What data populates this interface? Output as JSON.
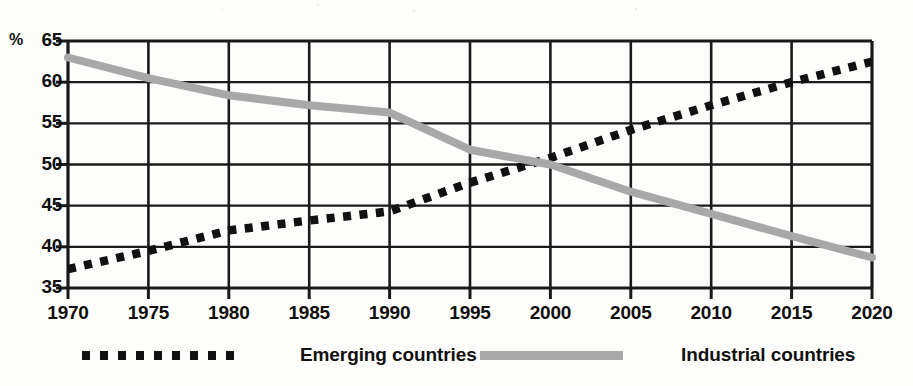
{
  "axis": {
    "unit_symbol": "%",
    "y_ticks": [
      "65",
      "60",
      "55",
      "50",
      "45",
      "40",
      "35"
    ],
    "x_ticks": [
      "1970",
      "1975",
      "1980",
      "1985",
      "1990",
      "1995",
      "2000",
      "2005",
      "2010",
      "2015",
      "2020"
    ]
  },
  "legend": {
    "items": [
      {
        "label": "Emerging countries",
        "style": "dotted",
        "color": "#111111"
      },
      {
        "label": "Industrial countries",
        "style": "solid",
        "color": "#a8a8a8"
      }
    ]
  },
  "colors": {
    "emerging": "#111111",
    "industrial": "#a8a8a8",
    "grid": "#1a1a1a",
    "background": "#fdfdfc"
  },
  "chart_data": {
    "type": "line",
    "title": "",
    "subtitle": "",
    "xlabel": "",
    "ylabel": "%",
    "xlim": [
      1970,
      2020
    ],
    "ylim": [
      35,
      65
    ],
    "ytick_step": 5,
    "xtick_step": 5,
    "grid": true,
    "legend_position": "bottom",
    "x": [
      1970,
      1975,
      1980,
      1985,
      1990,
      1995,
      2000,
      2005,
      2010,
      2015,
      2020
    ],
    "series": [
      {
        "name": "Emerging countries",
        "style": "dotted",
        "color": "#111111",
        "values": [
          37.3,
          39.5,
          42.0,
          43.2,
          44.3,
          47.8,
          50.8,
          54.2,
          57.2,
          60.0,
          62.5
        ]
      },
      {
        "name": "Industrial countries",
        "style": "solid",
        "color": "#a8a8a8",
        "values": [
          63.0,
          60.5,
          58.4,
          57.2,
          56.3,
          51.8,
          50.0,
          46.7,
          44.0,
          41.3,
          38.7
        ]
      }
    ],
    "annotations": [
      {
        "text": "series crossover",
        "x": 1997.8,
        "y": 49.8
      }
    ]
  }
}
